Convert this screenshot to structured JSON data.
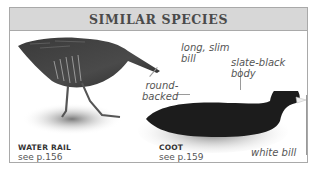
{
  "header": {
    "title": "SIMILAR SPECIES"
  },
  "species": [
    {
      "name": "WATER RAIL",
      "ref": "see p.156",
      "annotations": [
        "long, slim bill",
        "round-backed"
      ]
    },
    {
      "name": "COOT",
      "ref": "see p.159",
      "annotations": [
        "slate-black body",
        "white bill"
      ]
    }
  ],
  "annotations": {
    "long_slim_bill_1": "long, slim",
    "long_slim_bill_2": "bill",
    "round_backed_1": "round-",
    "round_backed_2": "backed",
    "slate_black_1": "slate-black",
    "slate_black_2": "body",
    "white_bill": "white bill"
  },
  "colors": {
    "header_bg": "#d7d7d7",
    "border": "#a9a9a9",
    "header_text": "#4a4a4a"
  }
}
